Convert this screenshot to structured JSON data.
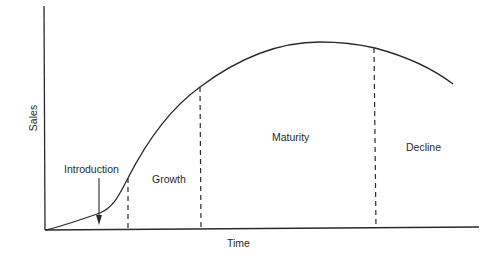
{
  "diagram": {
    "type": "product-life-cycle",
    "axes": {
      "x_label": "Time",
      "y_label": "Sales"
    },
    "stages": [
      {
        "name": "Introduction"
      },
      {
        "name": "Growth"
      },
      {
        "name": "Maturity"
      },
      {
        "name": "Decline"
      }
    ],
    "colors": {
      "line": "#2a2a2a",
      "background": "#ffffff"
    }
  }
}
